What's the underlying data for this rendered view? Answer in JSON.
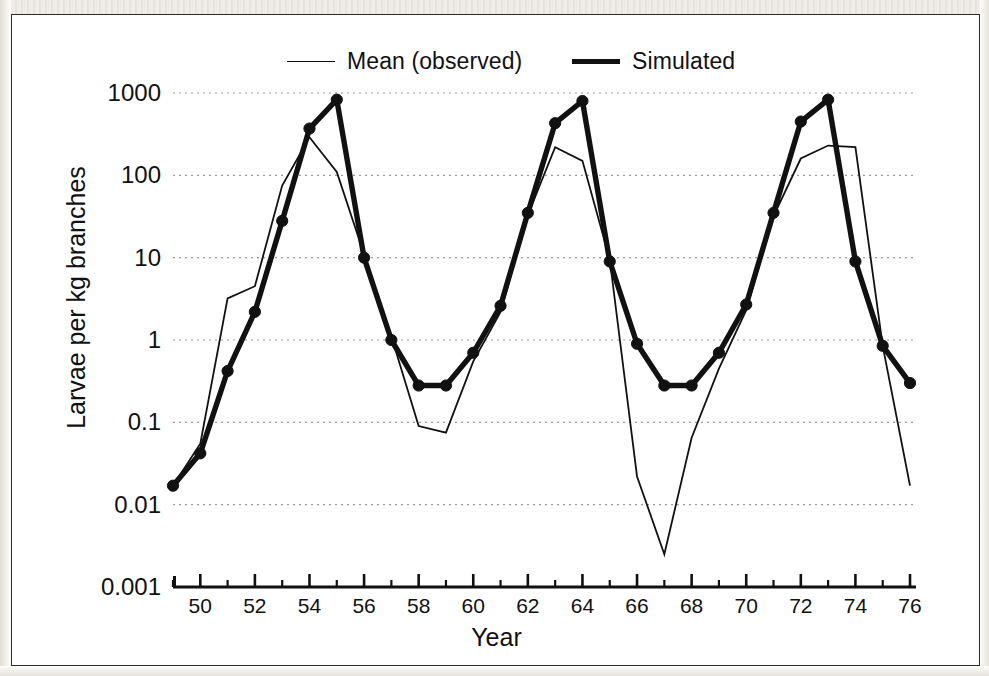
{
  "figure": {
    "background_color": "#ffffff",
    "ink_color": "#111111",
    "grid_color": "#9a9a9a"
  },
  "legend": {
    "position": "top-center",
    "entries": [
      {
        "label": "Mean (observed)",
        "style": "thin-line",
        "swatch": "line-swatch-thin"
      },
      {
        "label": "Simulated",
        "style": "thick-line",
        "swatch": "line-swatch-thick"
      }
    ]
  },
  "chart_data": {
    "type": "line",
    "title": "",
    "subtitle": "",
    "xlabel": "Year",
    "ylabel": "Larvae per kg branches",
    "yscale": "log",
    "ylim": [
      0.001,
      1000
    ],
    "xlim": [
      49,
      76
    ],
    "grid": true,
    "grid_axis": "y",
    "legend_position": "top-center",
    "ytick_labels": [
      "1000",
      "100",
      "10",
      "1",
      "0.1",
      "0.01",
      "0.001"
    ],
    "ytick_values": [
      1000,
      100,
      10,
      1,
      0.1,
      0.01,
      0.001
    ],
    "xtick_labels": [
      "50",
      "52",
      "54",
      "56",
      "58",
      "60",
      "62",
      "64",
      "66",
      "68",
      "70",
      "72",
      "74",
      "76"
    ],
    "xtick_values": [
      50,
      52,
      54,
      56,
      58,
      60,
      62,
      64,
      66,
      68,
      70,
      72,
      74,
      76
    ],
    "x_minor_ticks": [
      49,
      51,
      53,
      55,
      57,
      59,
      61,
      63,
      65,
      67,
      69,
      71,
      73,
      75
    ],
    "x": [
      49,
      50,
      51,
      52,
      53,
      54,
      55,
      56,
      57,
      58,
      59,
      60,
      61,
      62,
      63,
      64,
      65,
      66,
      67,
      68,
      69,
      70,
      71,
      72,
      73,
      74,
      75,
      76
    ],
    "series": [
      {
        "name": "Mean (observed)",
        "style": "thin-line",
        "markers": false,
        "values": [
          0.017,
          0.055,
          3.2,
          4.5,
          75,
          290,
          110,
          11,
          1.1,
          0.09,
          0.075,
          0.55,
          2.2,
          33,
          220,
          150,
          9.5,
          0.022,
          0.0025,
          0.065,
          0.45,
          2.3,
          32,
          160,
          230,
          220,
          0.85,
          0.017
        ]
      },
      {
        "name": "Simulated",
        "style": "thick-line",
        "markers": true,
        "values": [
          0.017,
          0.042,
          0.42,
          2.2,
          28,
          370,
          830,
          10,
          1.0,
          0.28,
          0.28,
          0.7,
          2.6,
          35,
          430,
          800,
          9.0,
          0.9,
          0.28,
          0.28,
          0.7,
          2.7,
          35,
          450,
          830,
          9.0,
          0.85,
          0.3
        ]
      }
    ]
  }
}
